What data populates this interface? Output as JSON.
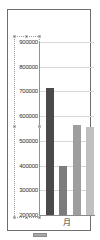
{
  "chart_data": {
    "type": "bar",
    "title": "",
    "subtitle": "",
    "xlabel": "月",
    "ylabel": "",
    "categories": [
      "1",
      "2",
      "3",
      "4"
    ],
    "values": [
      715000,
      398000,
      565000,
      555000
    ],
    "series": [
      {
        "name": "series-1",
        "values": [
          715000,
          398000,
          565000,
          555000
        ],
        "colors": [
          "#4a4a4a",
          "#7d7d7d",
          "#9e9e9e",
          "#c0c0c0"
        ]
      }
    ],
    "ylim": [
      200000,
      900000
    ],
    "yticks": [
      200000,
      300000,
      400000,
      500000,
      600000,
      700000,
      800000,
      900000
    ],
    "ytick_labels": [
      "200000",
      "300000",
      "400000",
      "500000",
      "600000",
      "700000",
      "800000",
      "900000"
    ],
    "grid": true,
    "legend": false,
    "legend_position": "below"
  },
  "axis": {
    "y_selected": true,
    "y_tick_labels": [
      "900000",
      "800000",
      "700000",
      "600000",
      "500000",
      "400000",
      "300000",
      "200000"
    ]
  },
  "colors": {
    "bar_1": "#4a4a4a",
    "bar_2": "#7d7d7d",
    "bar_3": "#9e9e9e",
    "bar_4": "#c0c0c0",
    "gridline": "#d8d8d8",
    "axis": "#8a8a8a",
    "frame": "#6e6e6e",
    "text": "#2b2b2b",
    "legend_swatch": "#a8a8a8"
  }
}
